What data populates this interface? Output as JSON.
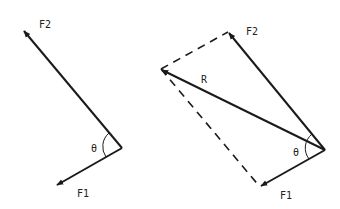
{
  "diagram": {
    "left": {
      "labels": {
        "f2": "F2",
        "f1": "F1",
        "theta": "θ"
      }
    },
    "right": {
      "labels": {
        "f2": "F2",
        "f1": "F1",
        "r": "R",
        "theta": "θ"
      }
    },
    "colors": {
      "stroke": "#1a1a1a",
      "background": "#ffffff"
    }
  }
}
